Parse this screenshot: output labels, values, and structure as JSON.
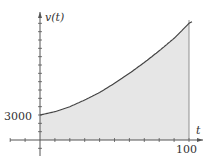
{
  "chart_data": {
    "type": "area",
    "title": "",
    "xlabel": "t",
    "ylabel": "v(t)",
    "x_tick_labels": [
      "100"
    ],
    "y_tick_labels": [
      "3000"
    ],
    "xlim": [
      -25,
      107
    ],
    "ylim": [
      -1800,
      15000
    ],
    "x_tick_step": 10,
    "y_tick_step": 1000,
    "grid": false,
    "shaded_region": {
      "from": 0,
      "to": 100,
      "fill": "#e6e6e6"
    },
    "series": [
      {
        "name": "v(t)",
        "x": [
          0,
          10,
          20,
          30,
          40,
          50,
          60,
          70,
          80,
          90,
          100
        ],
        "values": [
          3000,
          3400,
          4000,
          4800,
          5700,
          6800,
          8000,
          9300,
          10700,
          12200,
          14000
        ]
      }
    ],
    "annotations": [
      {
        "text": "3000",
        "at": {
          "x": 0,
          "y": 3000
        }
      },
      {
        "text": "100",
        "at": {
          "x": 100,
          "y": 0
        }
      }
    ]
  },
  "labels": {
    "y_axis": "v(t)",
    "x_axis": "t",
    "y_value": "3000",
    "x_value": "100"
  },
  "colors": {
    "curve": "#444444",
    "fill": "#e6e6e6",
    "axis": "#555555"
  }
}
